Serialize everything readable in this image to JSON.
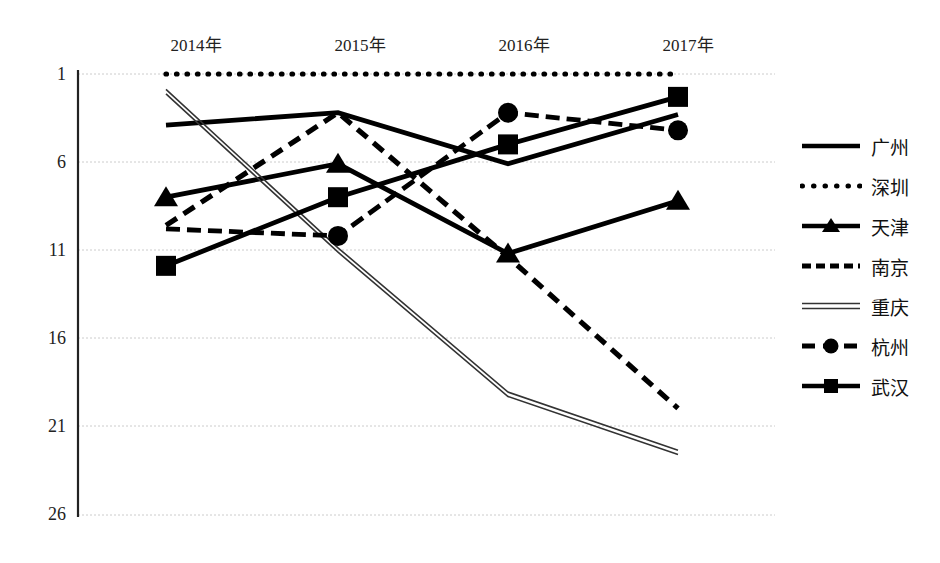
{
  "chart_data": {
    "type": "line",
    "title": "",
    "xlabel": "",
    "ylabel": "",
    "categories": [
      "2014年",
      "2015年",
      "2016年",
      "2017年"
    ],
    "x_tick_labels": [
      "2014年",
      "2015年",
      "2016年",
      "2017年"
    ],
    "y_tick_labels": [
      "1",
      "6",
      "11",
      "16",
      "21",
      "26"
    ],
    "y_ticks": [
      1,
      6,
      11,
      16,
      21,
      26
    ],
    "ylim": [
      1,
      26
    ],
    "y_axis_inverted": true,
    "grid": true,
    "legend_position": "right",
    "series": [
      {
        "name": "广州",
        "style": "solid",
        "marker": "none",
        "color": "#000000",
        "values": [
          3.9,
          3.2,
          6.1,
          3.3
        ]
      },
      {
        "name": "深圳",
        "style": "dotted",
        "marker": "none",
        "color": "#000000",
        "values": [
          1,
          1,
          1,
          1
        ]
      },
      {
        "name": "天津",
        "style": "solid",
        "marker": "triangle",
        "color": "#000000",
        "values": [
          8.0,
          6.1,
          11.2,
          8.2
        ]
      },
      {
        "name": "南京",
        "style": "dashed",
        "marker": "none",
        "color": "#000000",
        "values": [
          9.6,
          3.2,
          11.4,
          20.0
        ]
      },
      {
        "name": "重庆",
        "style": "thin-double",
        "marker": "none",
        "color": "#333333",
        "values": [
          2.0,
          11.0,
          19.2,
          22.5
        ]
      },
      {
        "name": "杭州",
        "style": "dash-dot",
        "marker": "circle",
        "color": "#000000",
        "values": [
          9.8,
          10.2,
          3.2,
          4.2
        ]
      },
      {
        "name": "武汉",
        "style": "solid",
        "marker": "square",
        "color": "#000000",
        "values": [
          11.9,
          8.0,
          5.0,
          2.3
        ]
      }
    ],
    "legend_entries": [
      "广州",
      "深圳",
      "天津",
      "南京",
      "重庆",
      "杭州",
      "武汉"
    ]
  }
}
